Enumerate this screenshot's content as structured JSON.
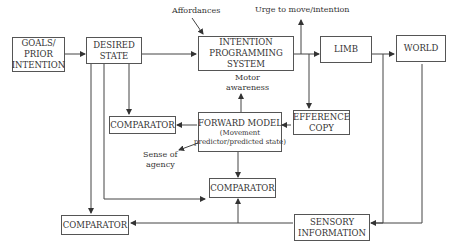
{
  "diagram": {
    "boxes": {
      "goals": {
        "lines": [
          "GOALS/",
          "PRIOR",
          "INTENTION"
        ]
      },
      "desired_state": {
        "lines": [
          "DESIRED",
          "STATE"
        ]
      },
      "intention_programming": {
        "lines": [
          "INTENTION",
          "PROGRAMMING",
          "SYSTEM"
        ]
      },
      "limb": {
        "lines": [
          "LIMB"
        ]
      },
      "world": {
        "lines": [
          "WORLD"
        ]
      },
      "comparator_1": {
        "lines": [
          "COMPARATOR"
        ]
      },
      "forward_model": {
        "lines": [
          "FORWARD MODEL",
          "(Movement",
          "predictor/predicted state)"
        ]
      },
      "efference_copy": {
        "lines": [
          "EFFERENCE",
          "COPY"
        ]
      },
      "comparator_2": {
        "lines": [
          "COMPARATOR"
        ]
      },
      "comparator_3": {
        "lines": [
          "COMPARATOR"
        ]
      },
      "sensory_information": {
        "lines": [
          "SENSORY",
          "INFORMATION"
        ]
      }
    },
    "labels": {
      "affordances": "Affordances",
      "urge": "Urge to move/intention",
      "motor_awareness": [
        "Motor",
        "awareness"
      ],
      "sense_of_agency": [
        "Sense of",
        "agency"
      ]
    },
    "colors": {
      "line": "#444444",
      "box_border": "#555555",
      "text": "#333333"
    }
  }
}
